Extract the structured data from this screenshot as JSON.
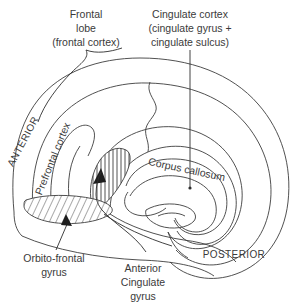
{
  "figure": {
    "background_color": "#ffffff",
    "line_color": "#3d3d3d",
    "text_color": "#3a3a3a"
  },
  "labels": {
    "frontal_lobe": {
      "line1": "Frontal",
      "line2": "lobe",
      "line3": "(frontal cortex)"
    },
    "cingulate_cortex": {
      "line1": "Cingulate cortex",
      "line2": "(cingulate gyrus +",
      "line3": "cingulate sulcus)"
    },
    "anterior": "ANTERIOR",
    "posterior": "POSTERIOR",
    "prefrontal_cortex": "Prefrontal cortex",
    "corpus_callosum": "Corpus callosum",
    "orbito_frontal_gyrus": {
      "line1": "Orbito-frontal",
      "line2": "gyrus"
    },
    "anterior_cingulate_gyrus": {
      "line1": "Anterior",
      "line2": "Cingulate",
      "line3": "gyrus"
    }
  },
  "regions": {
    "anterior_cingulate_gyrus_hatch": "vertical-hatch",
    "orbito_frontal_gyrus_hatch": "diagonal-hatch"
  }
}
